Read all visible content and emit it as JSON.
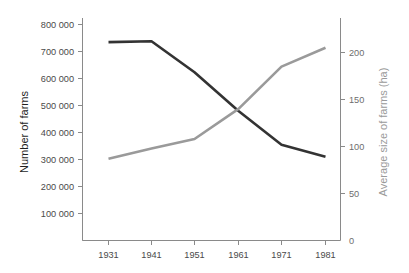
{
  "chart_data": {
    "type": "line",
    "title": "",
    "subtitle": "",
    "xlabel": "",
    "grid": false,
    "legend": "none",
    "x": [
      1931,
      1941,
      1951,
      1961,
      1971,
      1981
    ],
    "categories": [
      "1931",
      "1941",
      "1951",
      "1961",
      "1971",
      "1981"
    ],
    "xtick_labels": [
      "1931",
      "1941",
      "1951",
      "1961",
      "1971",
      "1981"
    ],
    "xlim": [
      1926,
      1986
    ],
    "series": [
      {
        "name": "Number of farms",
        "axis": "left",
        "color": "#333333",
        "values": [
          735000,
          738000,
          623000,
          480000,
          355000,
          310000
        ],
        "value_labels": [
          "735 000",
          "738 000",
          "623 000",
          "480 000",
          "355 000",
          "310 000"
        ]
      },
      {
        "name": "Average size of farms (ha)",
        "axis": "right",
        "color": "#9a9a9a",
        "values": [
          87,
          98,
          108,
          140,
          185,
          205
        ],
        "value_labels": [
          "87",
          "98",
          "108",
          "140",
          "185",
          "205"
        ]
      }
    ],
    "left_axis": {
      "label": "Number of farms",
      "ylim": [
        0,
        850000
      ],
      "ticks": [
        100000,
        200000,
        300000,
        400000,
        500000,
        600000,
        700000,
        800000
      ],
      "tick_labels": [
        "100 000",
        "200 000",
        "300 000",
        "400 000",
        "500 000",
        "600 000",
        "700 000",
        "800 000"
      ],
      "color": "#1f1f1f"
    },
    "right_axis": {
      "label": "Average size of farms (ha)",
      "ylim": [
        0,
        230
      ],
      "ticks": [
        0,
        50,
        100,
        150,
        200
      ],
      "tick_labels": [
        "0",
        "50",
        "100",
        "150",
        "200"
      ],
      "color": "#9a9a9a"
    }
  }
}
